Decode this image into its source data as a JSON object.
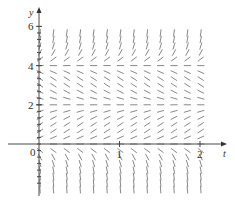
{
  "chart_data": {
    "type": "slope_field",
    "title": "",
    "xlabel": "t",
    "ylabel": "y",
    "x_ticks": [
      {
        "value": 1,
        "label": "1"
      },
      {
        "value": 2,
        "label": "2"
      }
    ],
    "y_ticks": [
      {
        "value": 2,
        "label": "2"
      },
      {
        "value": 4,
        "label": "4"
      },
      {
        "value": 6,
        "label": "6"
      }
    ],
    "origin_label": "0",
    "xlim": [
      0,
      2
    ],
    "ylim": [
      -2,
      6
    ],
    "equilibria": [
      0,
      2,
      4
    ],
    "slope_sign_by_region": {
      "y>4": "positive (steep)",
      "2<y<4": "negative",
      "0<y<2": "positive",
      "y<0": "negative (steep)"
    },
    "grid_columns": 13,
    "grid_row_spacing": 0.333,
    "grid": false,
    "legend": null
  },
  "layout": {
    "origin_px": [
      39,
      144
    ],
    "px_per_x": 80.5,
    "px_per_y": 19.6,
    "x_axis_end_px": 222,
    "y_axis_top_px": 12,
    "y_axis_bottom_px": 196,
    "x_axis_start_px": 8,
    "col_start_px": 40,
    "col_spacing_px": 13.4,
    "seg_len_px": 6.5
  }
}
